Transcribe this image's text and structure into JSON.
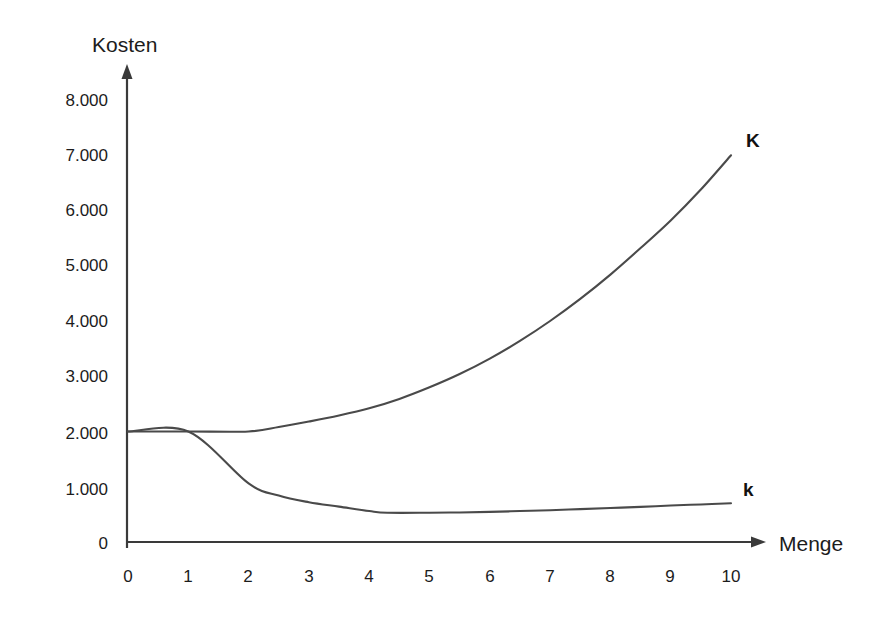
{
  "chart_data": {
    "type": "line",
    "title": "",
    "ylabel": "Kosten",
    "xlabel": "Menge",
    "xlim": [
      0,
      10
    ],
    "ylim": [
      0,
      8000
    ],
    "grid": false,
    "legend_position": "inline-right-end",
    "x_ticks": [
      "0",
      "1",
      "2",
      "3",
      "4",
      "5",
      "6",
      "7",
      "8",
      "9",
      "10"
    ],
    "y_ticks": [
      "0",
      "1.000",
      "2.000",
      "3.000",
      "4.000",
      "5.000",
      "6.000",
      "7.000",
      "8.000"
    ],
    "x_tick_values": [
      0,
      1,
      2,
      3,
      4,
      5,
      6,
      7,
      8,
      9,
      10
    ],
    "y_tick_values": [
      0,
      1000,
      2000,
      3000,
      4000,
      5000,
      6000,
      7000,
      8000
    ],
    "annotations": [
      {
        "text": "K",
        "x": 10.25,
        "y": 7150,
        "series": "K"
      },
      {
        "text": "k",
        "x": 10.2,
        "y": 830,
        "series": "k"
      }
    ],
    "series": [
      {
        "name": "K",
        "label": "K",
        "color": "#4a4a4a",
        "x": [
          0,
          1,
          2,
          2.5,
          3,
          3.5,
          4,
          4.5,
          5,
          5.5,
          6,
          6.5,
          7,
          7.5,
          8,
          8.5,
          9,
          9.5,
          10
        ],
        "values": [
          2000,
          2000,
          2000,
          2080,
          2180,
          2290,
          2420,
          2590,
          2800,
          3040,
          3320,
          3640,
          4000,
          4400,
          4840,
          5320,
          5820,
          6380,
          7000
        ]
      },
      {
        "name": "k",
        "label": "k",
        "color": "#4a4a4a",
        "x": [
          0,
          1,
          2,
          2.5,
          3,
          3.5,
          4,
          4.3,
          5,
          5.5,
          6,
          6.5,
          7,
          7.5,
          8,
          8.5,
          9,
          9.5,
          10
        ],
        "values": [
          2000,
          2000,
          1060,
          840,
          720,
          640,
          560,
          530,
          530,
          535,
          545,
          560,
          575,
          595,
          615,
          635,
          660,
          680,
          700
        ]
      }
    ]
  },
  "labels": {
    "y_axis_title": "Kosten",
    "x_axis_title": "Menge",
    "curve_total_cost": "K",
    "curve_unit_cost": "k"
  }
}
